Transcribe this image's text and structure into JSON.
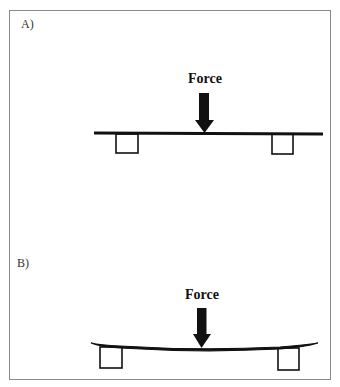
{
  "panels": [
    {
      "label": "A)",
      "state": "unloaded-straight",
      "force_label": "Force"
    },
    {
      "label": "B)",
      "state": "loaded-bent",
      "force_label": "Force"
    }
  ],
  "colors": {
    "frame": "#8a8a8a",
    "ink": "#111111",
    "background": "#ffffff"
  }
}
